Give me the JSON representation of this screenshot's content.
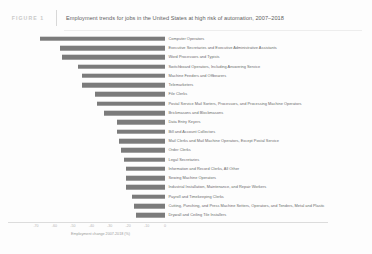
{
  "figure": {
    "badge": "FIGURE 1",
    "title": "Employment trends for jobs in the United States at high risk of automation, 2007–2018"
  },
  "colors": {
    "bar": "#7b7b7b",
    "badge_text": "#c9c9c9",
    "title_text": "#5d5d5d",
    "label_text": "#6a6a6a",
    "axis_text": "#b5b5b5",
    "background": "#fdfdfd"
  },
  "chart_data": {
    "type": "bar",
    "orientation": "horizontal",
    "title": "Employment trends for jobs in the United States at high risk of automation, 2007–2018",
    "xlabel": "Employment change 2007-2018 (%)",
    "ylabel": "",
    "xlim": [
      -70,
      0
    ],
    "grid": false,
    "legend": null,
    "xticks": [
      "-70",
      "-60",
      "-50",
      "-40",
      "-30",
      "-20",
      "-10",
      "0"
    ],
    "categories": [
      "Computer Operators",
      "Executive Secretaries and Executive Administrative Assistants",
      "Word Processors and Typists",
      "Switchboard Operators, Including Answering Service",
      "Machine Feeders and Offbearers",
      "Telemarketers",
      "File Clerks",
      "Postal Service Mail Sorters, Processors, and Processing Machine Operators",
      "Brickmasons and Blockmasons",
      "Data Entry Keyers",
      "Bill and Account Collectors",
      "Mail Clerks and Mail Machine Operators, Except Postal Service",
      "Order Clerks",
      "Legal Secretaries",
      "Information and Record Clerks, All Other",
      "Sewing Machine Operators",
      "Industrial Installation, Maintenance, and Repair Workers",
      "Payroll and Timekeeping Clerks",
      "Cutting, Punching, and Press Machine Setters, Operators, and Tenders, Metal and Plastic",
      "Drywall and Ceiling Tile Installers"
    ],
    "values": [
      -68,
      -57,
      -56,
      -47,
      -45,
      -45,
      -38,
      -37,
      -33,
      -26,
      -26,
      -25,
      -24,
      -22,
      -21,
      -21,
      -21,
      -18,
      -17,
      -16
    ]
  }
}
